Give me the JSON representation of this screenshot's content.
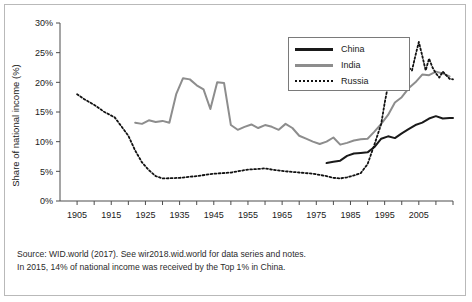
{
  "chart_data": {
    "type": "line",
    "title": "",
    "xlabel": "",
    "ylabel": "Share of national income (%)",
    "xlim": [
      1900,
      2015
    ],
    "ylim": [
      0,
      30
    ],
    "ytick_labels": [
      "0%",
      "5%",
      "10%",
      "15%",
      "20%",
      "25%",
      "30%"
    ],
    "ytick_values": [
      0,
      5,
      10,
      15,
      20,
      25,
      30
    ],
    "xtick_labels": [
      "1905",
      "1915",
      "1925",
      "1935",
      "1945",
      "1955",
      "1965",
      "1975",
      "1985",
      "1995",
      "2005"
    ],
    "xtick_values": [
      1905,
      1915,
      1925,
      1935,
      1945,
      1955,
      1965,
      1975,
      1985,
      1995,
      2005
    ],
    "grid": false,
    "legend_position": "top-right",
    "series": [
      {
        "name": "China",
        "color": "#1a1a1a",
        "style": "solid",
        "x": [
          1978,
          1980,
          1982,
          1984,
          1986,
          1988,
          1990,
          1992,
          1994,
          1996,
          1998,
          2000,
          2002,
          2004,
          2006,
          2008,
          2010,
          2012,
          2014,
          2015
        ],
        "values": [
          6.4,
          6.6,
          6.8,
          7.6,
          8.0,
          8.1,
          8.2,
          9.1,
          10.5,
          10.9,
          10.6,
          11.4,
          12.1,
          12.8,
          13.2,
          13.9,
          14.3,
          13.9,
          14.0,
          14.0
        ]
      },
      {
        "name": "India",
        "color": "#8d8d8d",
        "style": "solid",
        "x": [
          1922,
          1924,
          1926,
          1928,
          1930,
          1932,
          1934,
          1936,
          1938,
          1940,
          1942,
          1944,
          1946,
          1948,
          1950,
          1952,
          1954,
          1956,
          1958,
          1960,
          1962,
          1964,
          1966,
          1968,
          1970,
          1972,
          1974,
          1976,
          1978,
          1980,
          1982,
          1984,
          1986,
          1988,
          1990,
          1992,
          1994,
          1996,
          1998,
          2000,
          2002,
          2004,
          2006,
          2008,
          2010,
          2012,
          2014
        ],
        "values": [
          13.2,
          13.0,
          13.6,
          13.3,
          13.5,
          13.2,
          18.0,
          20.7,
          20.5,
          19.5,
          18.8,
          15.5,
          20.0,
          19.9,
          12.8,
          12.0,
          12.5,
          12.9,
          12.3,
          12.8,
          12.5,
          12.0,
          13.0,
          12.3,
          11.0,
          10.5,
          10.0,
          9.6,
          10.0,
          10.7,
          9.5,
          9.8,
          10.2,
          10.4,
          10.5,
          11.7,
          13.0,
          14.5,
          16.6,
          17.5,
          19.0,
          20.0,
          21.3,
          21.2,
          21.8,
          21.5,
          21.0
        ]
      },
      {
        "name": "Russia",
        "color": "#111111",
        "style": "dotted",
        "x": [
          1905,
          1907,
          1910,
          1913,
          1916,
          1920,
          1922,
          1924,
          1926,
          1928,
          1930,
          1935,
          1940,
          1945,
          1950,
          1955,
          1958,
          1960,
          1963,
          1966,
          1970,
          1974,
          1978,
          1980,
          1982,
          1984,
          1986,
          1988,
          1990,
          1992,
          1994,
          1995,
          1996,
          1997,
          1998,
          1999,
          2000,
          2001,
          2002,
          2003,
          2004,
          2005,
          2006,
          2007,
          2008,
          2009,
          2010,
          2011,
          2012,
          2013,
          2014,
          2015
        ],
        "values": [
          18.0,
          17.2,
          16.2,
          15.0,
          14.1,
          11.0,
          8.5,
          6.5,
          5.2,
          4.2,
          3.8,
          3.9,
          4.2,
          4.6,
          4.8,
          5.3,
          5.4,
          5.5,
          5.2,
          5.0,
          4.8,
          4.6,
          4.2,
          3.9,
          3.8,
          4.0,
          4.3,
          4.7,
          6.2,
          9.5,
          13.0,
          16.5,
          19.5,
          22.0,
          22.5,
          23.0,
          24.0,
          23.5,
          22.5,
          22.0,
          24.5,
          26.8,
          24.5,
          22.0,
          24.0,
          22.5,
          21.5,
          20.8,
          21.8,
          21.2,
          20.6,
          20.5
        ]
      }
    ]
  },
  "legend": {
    "items": [
      {
        "label": "China"
      },
      {
        "label": "India"
      },
      {
        "label": "Russia"
      }
    ]
  },
  "footer": {
    "line1": "Source: WID.world (2017). See wir2018.wid.world for data series and notes.",
    "line2": "In 2015, 14% of national income was received by the Top 1% in China."
  }
}
